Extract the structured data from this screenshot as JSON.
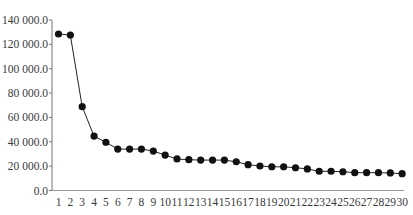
{
  "chart_data": {
    "type": "line",
    "title": "",
    "xlabel": "",
    "ylabel": "",
    "x": [
      1,
      2,
      3,
      4,
      5,
      6,
      7,
      8,
      9,
      10,
      11,
      12,
      13,
      14,
      15,
      16,
      17,
      18,
      19,
      20,
      21,
      22,
      23,
      24,
      25,
      26,
      27,
      28,
      29,
      30
    ],
    "series": [
      {
        "name": "",
        "values": [
          128500,
          127700,
          68800,
          44700,
          39600,
          34000,
          34000,
          34000,
          32400,
          29100,
          25900,
          25300,
          25000,
          25000,
          25000,
          23600,
          21200,
          20100,
          19500,
          19500,
          18700,
          17700,
          15800,
          15800,
          15400,
          14600,
          14600,
          14600,
          14400,
          13800
        ],
        "color": "#111111",
        "marker": "circle"
      }
    ],
    "ylim": [
      0,
      140000
    ],
    "yticks": [
      0,
      20000,
      40000,
      60000,
      80000,
      100000,
      120000,
      140000
    ],
    "ytick_labels": [
      "0.0",
      "20 000.0",
      "40 000.0",
      "60 000.0",
      "80 000.0",
      "100 000.0",
      "120 000.0",
      "140 000.0"
    ],
    "xtick_labels": [
      "1",
      "2",
      "3",
      "4",
      "5",
      "6",
      "7",
      "8",
      "9",
      "10",
      "11",
      "12",
      "13",
      "14",
      "15",
      "16",
      "17",
      "18",
      "19",
      "20",
      "21",
      "22",
      "23",
      "24",
      "25",
      "26",
      "27",
      "28",
      "29",
      "30"
    ],
    "grid": false,
    "legend": "none"
  }
}
